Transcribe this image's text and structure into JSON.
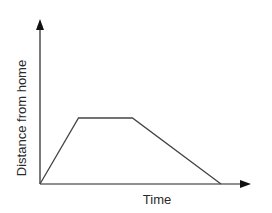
{
  "chart_data": {
    "type": "line",
    "title": "",
    "xlabel": "Time",
    "ylabel": "Distance from home",
    "grid": false,
    "legend": null,
    "ticks": {
      "x": [],
      "y": []
    },
    "series": [
      {
        "name": "journey",
        "points": [
          {
            "x": 0,
            "y": 0
          },
          {
            "x": 1,
            "y": 1
          },
          {
            "x": 2.4,
            "y": 1
          },
          {
            "x": 4.7,
            "y": 0
          }
        ]
      }
    ],
    "annotations": []
  },
  "colors": {
    "line": "#444444",
    "axis": "#222222",
    "text": "#2a2a2a",
    "background": "#ffffff"
  }
}
